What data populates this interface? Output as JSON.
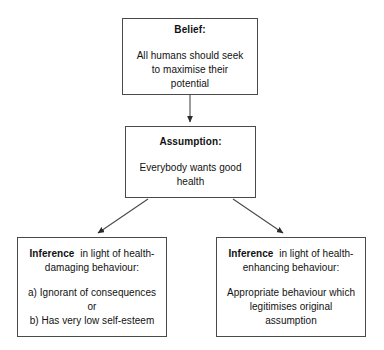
{
  "diagram": {
    "background_color": "#ffffff",
    "line_color": "#4a4a4a",
    "text_color": "#111111",
    "nodes": {
      "belief": {
        "heading": "Belief:",
        "body_line_1": "All humans should seek",
        "body_line_2": "to maximise their",
        "body_line_3": "potential"
      },
      "assumption": {
        "heading": "Assumption:",
        "body_line_1": "Everybody wants good",
        "body_line_2": "health"
      },
      "inference_damaging": {
        "heading_bold": "Inference",
        "heading_rest": "in light of health-",
        "heading_line_2": "damaging behaviour:",
        "option_a": "a) Ignorant of consequences",
        "conjunction": "or",
        "option_b": "b) Has very low self-esteem"
      },
      "inference_enhancing": {
        "heading_bold": "Inference",
        "heading_rest": "in light of health-",
        "heading_line_2": "enhancing behaviour:",
        "body_line_1": "Appropriate behaviour which",
        "body_line_2": "legitimises original",
        "body_line_3": "assumption"
      }
    },
    "connectors": [
      {
        "name": "belief-to-assumption",
        "from": "belief",
        "to": "assumption",
        "style": "straight-arrow"
      },
      {
        "name": "assumption-to-inference-damaging",
        "from": "assumption",
        "to": "inference_damaging",
        "style": "diagonal-arrow"
      },
      {
        "name": "assumption-to-inference-enhancing",
        "from": "assumption",
        "to": "inference_enhancing",
        "style": "diagonal-arrow"
      }
    ]
  }
}
